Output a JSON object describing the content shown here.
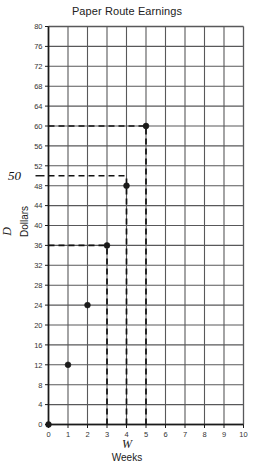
{
  "chart_data": {
    "type": "line",
    "title": "Paper Route Earnings",
    "xlabel_var": "W",
    "xlabel": "Weeks",
    "ylabel_var": "D",
    "ylabel": "Dollars",
    "x": [
      0,
      1,
      2,
      3,
      4,
      5
    ],
    "values": [
      0,
      12,
      24,
      36,
      48,
      60
    ],
    "series": [
      {
        "name": "Earnings",
        "x": [
          0,
          1,
          2,
          3,
          4,
          5
        ],
        "values": [
          0,
          12,
          24,
          36,
          48,
          60
        ]
      }
    ],
    "xlim": [
      0,
      10
    ],
    "ylim": [
      0,
      80
    ],
    "x_ticks": [
      0,
      1,
      2,
      3,
      4,
      5,
      6,
      7,
      8,
      9,
      10
    ],
    "y_ticks": [
      0,
      4,
      8,
      12,
      16,
      20,
      24,
      28,
      32,
      36,
      40,
      44,
      48,
      52,
      56,
      60,
      64,
      68,
      72,
      76,
      80
    ],
    "grid": true,
    "grid_x_step": 1,
    "grid_y_step": 4,
    "legend": "none",
    "point_color": "#1a1a1a",
    "grid_color": "#58585a",
    "axis_color": "#1a1a1a",
    "annotations": [
      {
        "label": "50",
        "kind": "axis-callout",
        "axis": "y",
        "value": 50
      },
      {
        "kind": "dashed-guide",
        "y": 60,
        "from_x": 0,
        "to_x": 5
      },
      {
        "kind": "dashed-guide",
        "y": 50,
        "from_x": 0,
        "to_x": 4
      },
      {
        "kind": "dashed-guide",
        "y": 36,
        "from_x": 0,
        "to_x": 3
      },
      {
        "kind": "dashed-guide",
        "x": 5,
        "from_y": 0,
        "to_y": 60
      },
      {
        "kind": "dashed-guide",
        "x": 4,
        "from_y": 0,
        "to_y": 50
      },
      {
        "kind": "dashed-guide",
        "x": 3,
        "from_y": 0,
        "to_y": 36
      }
    ]
  }
}
